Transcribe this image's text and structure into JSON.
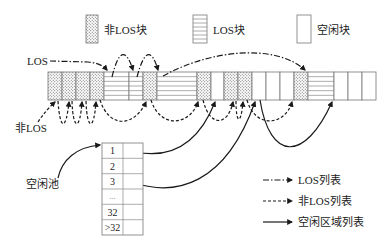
{
  "figure": {
    "legend_top": [
      {
        "type": "non-los",
        "label": "非LOS块"
      },
      {
        "type": "los",
        "label": "LOS块"
      },
      {
        "type": "free",
        "label": "空闲块"
      }
    ],
    "labels": {
      "los": "LOS",
      "non_los": "非LOS",
      "free_pool": "空闲池"
    },
    "memory_bar": {
      "blocks": [
        "non-los",
        "non-los",
        "non-los",
        "non-los",
        "los",
        "los",
        "non-los",
        "los",
        "non-los",
        "free",
        "non-los",
        "non-los",
        "free",
        "free",
        "free",
        "non-los",
        "los",
        "free",
        "free",
        "free"
      ]
    },
    "pool": {
      "rows": [
        "1",
        "2",
        "3",
        "...",
        "32",
        ">32"
      ]
    },
    "legend_bottom": [
      {
        "style": "dash-dot",
        "label": "LOS列表"
      },
      {
        "style": "dashed",
        "label": "非LOS列表"
      },
      {
        "style": "solid",
        "label": "空闲区域列表"
      }
    ],
    "colors": {
      "arrow": "#1a1a1a",
      "block_border": "#777777",
      "dot_fill": "#555555"
    }
  }
}
